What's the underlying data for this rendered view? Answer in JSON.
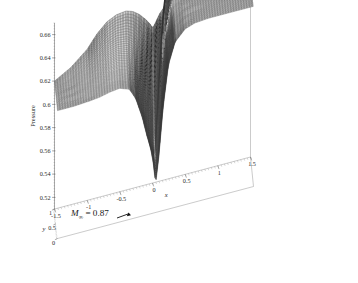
{
  "figure": {
    "type": "3d-surface-mesh",
    "background_color": "#ffffff",
    "line_color": "#3a3a3a",
    "annotation": {
      "mach_symbol": "M",
      "mach_subscript": "∞",
      "equals_value": "= 0.87",
      "full_text": "M∞ = 0.87",
      "arrow_icon": "arrow-right-icon"
    }
  },
  "axes": {
    "z": {
      "title": "Pressure",
      "ticks": [
        "0.52",
        "0.54",
        "0.56",
        "0.58",
        "0.6",
        "0.62",
        "0.64",
        "0.66"
      ],
      "values": [
        0.52,
        0.54,
        0.56,
        0.58,
        0.6,
        0.62,
        0.64,
        0.66
      ],
      "range": [
        0.51,
        0.67
      ]
    },
    "x": {
      "title": "x",
      "ticks": [
        "-1.5",
        "-1",
        "-0.5",
        "0",
        "0.5",
        "1",
        "1.5"
      ],
      "values": [
        -1.5,
        -1,
        -0.5,
        0,
        0.5,
        1,
        1.5
      ],
      "range": [
        -1.5,
        1.5
      ]
    },
    "y": {
      "title": "y",
      "ticks": [
        "0",
        "0.5",
        "1"
      ],
      "values": [
        0,
        0.5,
        1
      ],
      "range": [
        0,
        1
      ]
    }
  },
  "chart_data": {
    "type": "line",
    "title": "",
    "subtitle": "",
    "xlabel": "x",
    "ylabel": "y",
    "zlabel": "Pressure",
    "xlim": [
      -1.5,
      1.5
    ],
    "ylim": [
      0,
      1
    ],
    "zlim": [
      0.51,
      0.67
    ],
    "grid": false,
    "legend": "none",
    "annotations": [
      "M∞ = 0.87"
    ],
    "x": [
      -1.5,
      -1.25,
      -1.0,
      -0.85,
      -0.7,
      -0.55,
      -0.4,
      -0.3,
      -0.2,
      -0.1,
      -0.02,
      0.0,
      0.05,
      0.12,
      0.2,
      0.3,
      0.45,
      0.6,
      0.8,
      1.0,
      1.25,
      1.5
    ],
    "series": [
      {
        "name": "y = 0.00",
        "values": [
          0.62,
          0.62,
          0.621,
          0.622,
          0.624,
          0.625,
          0.622,
          0.612,
          0.594,
          0.57,
          0.545,
          0.533,
          0.556,
          0.6,
          0.634,
          0.652,
          0.661,
          0.664,
          0.665,
          0.665,
          0.665,
          0.665
        ]
      },
      {
        "name": "y = 0.10",
        "values": [
          0.62,
          0.62,
          0.621,
          0.623,
          0.625,
          0.626,
          0.623,
          0.613,
          0.596,
          0.572,
          0.548,
          0.536,
          0.558,
          0.601,
          0.635,
          0.652,
          0.661,
          0.664,
          0.665,
          0.665,
          0.665,
          0.665
        ]
      },
      {
        "name": "y = 0.20",
        "values": [
          0.62,
          0.62,
          0.622,
          0.624,
          0.626,
          0.627,
          0.624,
          0.615,
          0.598,
          0.575,
          0.552,
          0.54,
          0.561,
          0.603,
          0.636,
          0.653,
          0.661,
          0.664,
          0.665,
          0.665,
          0.665,
          0.665
        ]
      },
      {
        "name": "y = 0.30",
        "values": [
          0.62,
          0.621,
          0.623,
          0.625,
          0.628,
          0.629,
          0.626,
          0.617,
          0.601,
          0.579,
          0.557,
          0.546,
          0.566,
          0.606,
          0.637,
          0.654,
          0.662,
          0.664,
          0.665,
          0.665,
          0.665,
          0.665
        ]
      },
      {
        "name": "y = 0.40",
        "values": [
          0.62,
          0.621,
          0.624,
          0.627,
          0.63,
          0.631,
          0.629,
          0.621,
          0.606,
          0.585,
          0.564,
          0.554,
          0.572,
          0.61,
          0.639,
          0.655,
          0.662,
          0.664,
          0.665,
          0.665,
          0.665,
          0.665
        ]
      },
      {
        "name": "y = 0.50",
        "values": [
          0.62,
          0.622,
          0.625,
          0.629,
          0.633,
          0.634,
          0.632,
          0.625,
          0.611,
          0.592,
          0.573,
          0.563,
          0.58,
          0.615,
          0.641,
          0.656,
          0.663,
          0.665,
          0.665,
          0.665,
          0.665,
          0.665
        ]
      },
      {
        "name": "y = 0.60",
        "values": [
          0.62,
          0.622,
          0.627,
          0.632,
          0.636,
          0.638,
          0.636,
          0.63,
          0.618,
          0.601,
          0.583,
          0.574,
          0.59,
          0.621,
          0.644,
          0.657,
          0.663,
          0.665,
          0.665,
          0.665,
          0.665,
          0.665
        ]
      },
      {
        "name": "y = 0.70",
        "values": [
          0.62,
          0.623,
          0.629,
          0.635,
          0.64,
          0.642,
          0.641,
          0.636,
          0.626,
          0.611,
          0.595,
          0.587,
          0.601,
          0.628,
          0.647,
          0.658,
          0.664,
          0.665,
          0.665,
          0.665,
          0.665,
          0.665
        ]
      },
      {
        "name": "y = 0.80",
        "values": [
          0.62,
          0.624,
          0.632,
          0.639,
          0.645,
          0.648,
          0.647,
          0.643,
          0.635,
          0.623,
          0.61,
          0.603,
          0.615,
          0.636,
          0.651,
          0.66,
          0.664,
          0.665,
          0.665,
          0.665,
          0.665,
          0.665
        ]
      },
      {
        "name": "y = 0.90",
        "values": [
          0.62,
          0.626,
          0.636,
          0.645,
          0.652,
          0.655,
          0.655,
          0.652,
          0.646,
          0.637,
          0.627,
          0.622,
          0.631,
          0.645,
          0.655,
          0.661,
          0.664,
          0.665,
          0.665,
          0.665,
          0.665,
          0.665
        ]
      },
      {
        "name": "y = 1.00",
        "values": [
          0.62,
          0.628,
          0.64,
          0.651,
          0.659,
          0.663,
          0.664,
          0.662,
          0.658,
          0.652,
          0.646,
          0.643,
          0.648,
          0.655,
          0.66,
          0.663,
          0.665,
          0.665,
          0.665,
          0.665,
          0.665,
          0.665
        ]
      }
    ]
  }
}
